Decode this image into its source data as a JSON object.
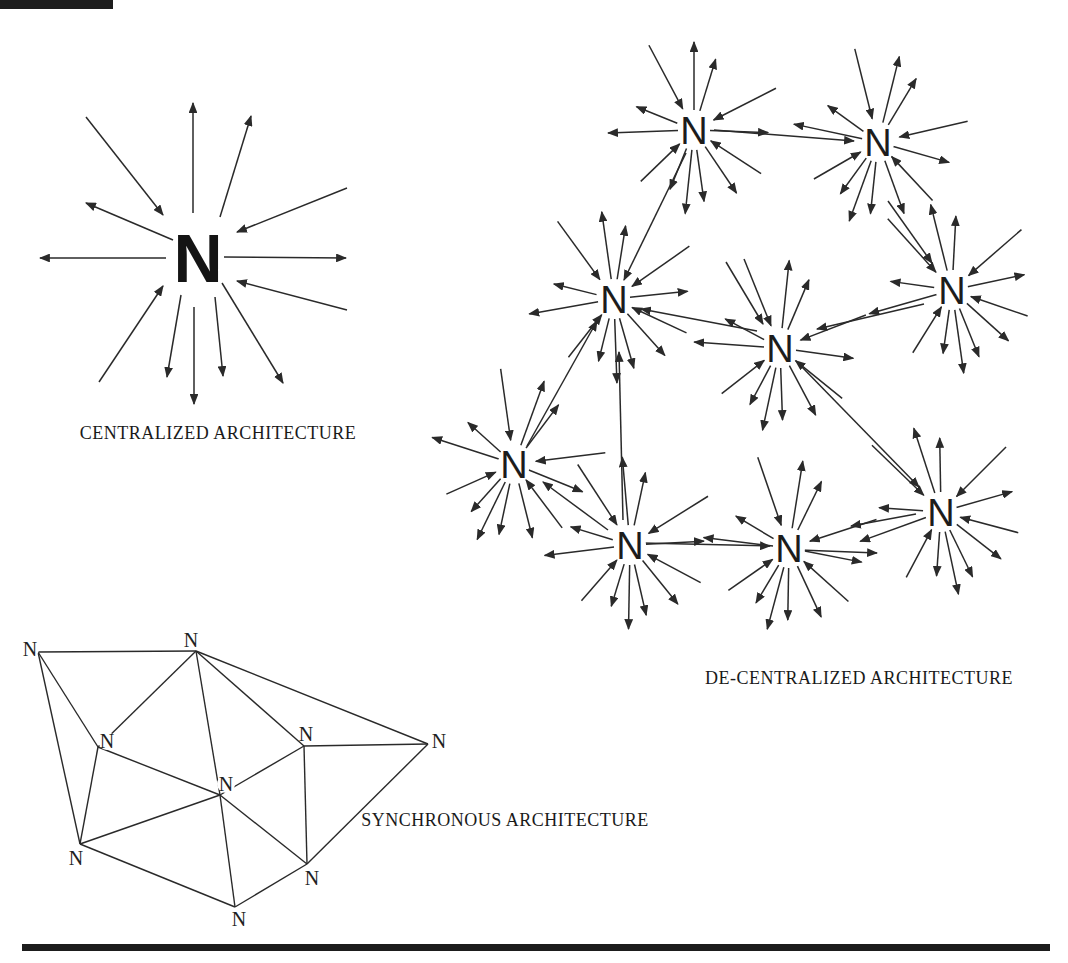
{
  "figure": {
    "background": "#ffffff",
    "ink": "#2a2a2a",
    "top_mark": {
      "x": 0,
      "y": 0,
      "w": 113,
      "h": 9
    },
    "bottom_rule": {
      "x": 22,
      "y": 944,
      "w": 1028,
      "h": 7
    }
  },
  "centralized": {
    "label": "CENTRALIZED ARCHITECTURE",
    "label_pos": {
      "x": 218,
      "y": 433
    },
    "node": {
      "x": 198,
      "y": 258,
      "label": "N"
    },
    "arrows": [
      {
        "x1": 193,
        "y1": 213,
        "x2": 193,
        "y2": 103
      },
      {
        "x1": 220,
        "y1": 217,
        "x2": 251,
        "y2": 116
      },
      {
        "x1": 86,
        "y1": 117,
        "x2": 163,
        "y2": 215
      },
      {
        "x1": 173,
        "y1": 240,
        "x2": 86,
        "y2": 203
      },
      {
        "x1": 166,
        "y1": 258,
        "x2": 40,
        "y2": 258
      },
      {
        "x1": 224,
        "y1": 257,
        "x2": 346,
        "y2": 258
      },
      {
        "x1": 347,
        "y1": 188,
        "x2": 237,
        "y2": 232
      },
      {
        "x1": 347,
        "y1": 310,
        "x2": 237,
        "y2": 281
      },
      {
        "x1": 99,
        "y1": 382,
        "x2": 163,
        "y2": 286
      },
      {
        "x1": 181,
        "y1": 295,
        "x2": 167,
        "y2": 377
      },
      {
        "x1": 194,
        "y1": 307,
        "x2": 194,
        "y2": 404
      },
      {
        "x1": 215,
        "y1": 297,
        "x2": 223,
        "y2": 376
      },
      {
        "x1": 222,
        "y1": 283,
        "x2": 283,
        "y2": 383
      }
    ]
  },
  "decentralized": {
    "label": "DE-CENTRALIZED ARCHITECTURE",
    "label_pos": {
      "x": 859,
      "y": 678
    },
    "node_label": "N",
    "nodes": [
      {
        "x": 694,
        "y": 130,
        "rot": 0
      },
      {
        "x": 878,
        "y": 142,
        "rot": 14
      },
      {
        "x": 614,
        "y": 299,
        "rot": -8
      },
      {
        "x": 780,
        "y": 348,
        "rot": 6
      },
      {
        "x": 952,
        "y": 290,
        "rot": -14
      },
      {
        "x": 514,
        "y": 464,
        "rot": 20
      },
      {
        "x": 630,
        "y": 545,
        "rot": -5
      },
      {
        "x": 789,
        "y": 548,
        "rot": 9
      },
      {
        "x": 941,
        "y": 512,
        "rot": -18
      }
    ],
    "star_rays": [
      {
        "a": -90,
        "r1": 20,
        "r2": 88,
        "d": "out"
      },
      {
        "a": -73,
        "r1": 20,
        "r2": 74,
        "d": "out"
      },
      {
        "a": -118,
        "r1": 24,
        "r2": 96,
        "d": "in"
      },
      {
        "a": -158,
        "r1": 18,
        "r2": 62,
        "d": "out"
      },
      {
        "a": -27,
        "r1": 22,
        "r2": 92,
        "d": "in"
      },
      {
        "a": 2,
        "r1": 16,
        "r2": 74,
        "d": "out"
      },
      {
        "a": 178,
        "r1": 16,
        "r2": 86,
        "d": "out"
      },
      {
        "a": 33,
        "r1": 20,
        "r2": 80,
        "d": "in"
      },
      {
        "a": 56,
        "r1": 20,
        "r2": 76,
        "d": "out"
      },
      {
        "a": 82,
        "r1": 20,
        "r2": 72,
        "d": "out"
      },
      {
        "a": 96,
        "r1": 20,
        "r2": 84,
        "d": "out"
      },
      {
        "a": 112,
        "r1": 20,
        "r2": 64,
        "d": "out"
      },
      {
        "a": 136,
        "r1": 20,
        "r2": 74,
        "d": "in"
      }
    ],
    "links": [
      {
        "x1": 714,
        "y1": 130,
        "x2": 854,
        "y2": 141
      },
      {
        "x1": 686,
        "y1": 153,
        "x2": 624,
        "y2": 280
      },
      {
        "x1": 726,
        "y1": 262,
        "x2": 763,
        "y2": 324
      },
      {
        "x1": 757,
        "y1": 331,
        "x2": 641,
        "y2": 309
      },
      {
        "x1": 527,
        "y1": 446,
        "x2": 597,
        "y2": 321
      },
      {
        "x1": 623,
        "y1": 520,
        "x2": 619,
        "y2": 352
      },
      {
        "x1": 888,
        "y1": 201,
        "x2": 932,
        "y2": 263
      },
      {
        "x1": 924,
        "y1": 304,
        "x2": 817,
        "y2": 329
      },
      {
        "x1": 801,
        "y1": 366,
        "x2": 919,
        "y2": 487
      },
      {
        "x1": 916,
        "y1": 514,
        "x2": 851,
        "y2": 526
      },
      {
        "x1": 642,
        "y1": 543,
        "x2": 770,
        "y2": 546
      },
      {
        "x1": 608,
        "y1": 530,
        "x2": 543,
        "y2": 482
      },
      {
        "x1": 800,
        "y1": 550,
        "x2": 877,
        "y2": 553
      }
    ]
  },
  "synchronous": {
    "label": "SYNCHRONOUS ARCHITECTURE",
    "label_pos": {
      "x": 505,
      "y": 820
    },
    "node_label": "N",
    "nodes": [
      {
        "x": 38,
        "y": 652,
        "lx": 30,
        "ly": 649
      },
      {
        "x": 196,
        "y": 651,
        "lx": 191,
        "ly": 640
      },
      {
        "x": 98,
        "y": 747,
        "lx": 107,
        "ly": 741
      },
      {
        "x": 220,
        "y": 795,
        "lx": 226,
        "ly": 784
      },
      {
        "x": 304,
        "y": 746,
        "lx": 306,
        "ly": 734
      },
      {
        "x": 428,
        "y": 744,
        "lx": 439,
        "ly": 741
      },
      {
        "x": 80,
        "y": 844,
        "lx": 76,
        "ly": 858
      },
      {
        "x": 307,
        "y": 864,
        "lx": 312,
        "ly": 878
      },
      {
        "x": 235,
        "y": 907,
        "lx": 239,
        "ly": 919
      }
    ],
    "edges": [
      [
        0,
        1
      ],
      [
        0,
        2
      ],
      [
        0,
        6
      ],
      [
        1,
        2
      ],
      [
        1,
        3
      ],
      [
        1,
        4
      ],
      [
        1,
        5
      ],
      [
        2,
        3
      ],
      [
        2,
        6
      ],
      [
        3,
        4
      ],
      [
        3,
        6
      ],
      [
        3,
        7
      ],
      [
        3,
        8
      ],
      [
        4,
        5
      ],
      [
        4,
        7
      ],
      [
        5,
        7
      ],
      [
        6,
        8
      ],
      [
        7,
        8
      ]
    ]
  }
}
